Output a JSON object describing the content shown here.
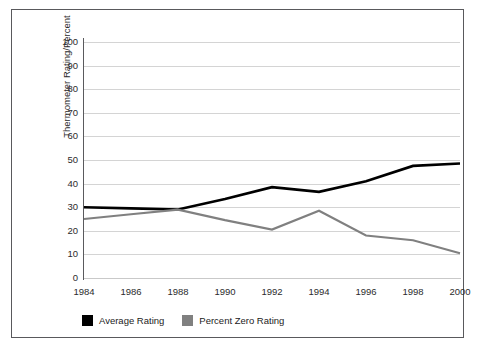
{
  "chart_data": {
    "type": "line",
    "title": "",
    "xlabel": "",
    "ylabel": "Thermometer Rating/Percent",
    "x": [
      1984,
      1986,
      1988,
      1990,
      1992,
      1994,
      1996,
      1998,
      2000
    ],
    "xtick_labels": [
      "1984",
      "1986",
      "1988",
      "1990",
      "1992",
      "1994",
      "1996",
      "1998",
      "2000"
    ],
    "ytick_labels": [
      "100",
      "90",
      "80",
      "70",
      "60",
      "50",
      "40",
      "30",
      "20",
      "10",
      "0"
    ],
    "ytick_values": [
      100,
      90,
      80,
      70,
      60,
      50,
      40,
      30,
      20,
      10,
      0
    ],
    "ylim": [
      0,
      100
    ],
    "xlim": [
      1984,
      2000
    ],
    "grid": "horizontal",
    "legend_position": "bottom-left",
    "series": [
      {
        "name": "Average Rating",
        "color": "#000000",
        "values": [
          30,
          29.5,
          29,
          33.5,
          38.5,
          36.5,
          41,
          47.5,
          48.5
        ]
      },
      {
        "name": "Percent Zero Rating",
        "color": "#808080",
        "values": [
          25,
          27,
          29,
          24.5,
          20.5,
          28.5,
          18,
          16,
          10.5
        ]
      }
    ]
  },
  "legend": {
    "entries": [
      {
        "label": "Average Rating",
        "color": "#000000",
        "swatch": "black-square-swatch"
      },
      {
        "label": "Percent Zero Rating",
        "color": "#808080",
        "swatch": "gray-square-swatch"
      }
    ]
  },
  "style": {
    "border_color": "#59595c",
    "grid_color": "#d4d4d4",
    "axis_color": "#5a5a5d",
    "background": "#ffffff",
    "text_color": "#2b2b2b"
  }
}
